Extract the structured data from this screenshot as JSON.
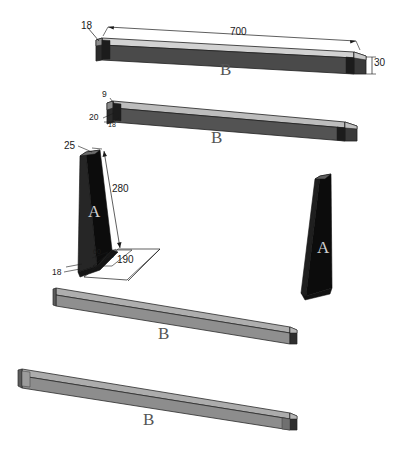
{
  "drawing": {
    "background_color": "#ffffff",
    "line_color": "#1a1a1a",
    "parts": [
      {
        "id": "bar-b-top",
        "part_label": "B",
        "color_top": "#cfcfcf",
        "color_face": "#4d4d4d",
        "color_end": "#3a3a3a",
        "dimensions": [
          {
            "name": "width-left",
            "value": "18"
          },
          {
            "name": "length",
            "value": "700"
          },
          {
            "name": "height-right",
            "value": "30"
          }
        ]
      },
      {
        "id": "bar-b-second",
        "part_label": "B",
        "color_top": "#b8b8b8",
        "color_face": "#555555",
        "color_end": "#3a3a3a",
        "dimensions": [
          {
            "name": "thickness-top",
            "value": "9"
          },
          {
            "name": "height",
            "value": "20"
          },
          {
            "name": "width",
            "value": "18"
          }
        ]
      },
      {
        "id": "bracket-a-left",
        "part_label": "A",
        "color_face": "#0c0c0c",
        "color_side": "#2a2a2a",
        "dimensions": [
          {
            "name": "top-width",
            "value": "25"
          },
          {
            "name": "slant-height",
            "value": "280"
          },
          {
            "name": "base-depth",
            "value": "190"
          },
          {
            "name": "base-inner-a",
            "value": "60"
          },
          {
            "name": "base-inner-b",
            "value": "90"
          },
          {
            "name": "base-thickness",
            "value": "18"
          }
        ]
      },
      {
        "id": "bracket-a-right",
        "part_label": "A",
        "color_face": "#0c0c0c",
        "color_side": "#242424",
        "dimensions": []
      },
      {
        "id": "bar-b-third",
        "part_label": "B",
        "color_top": "#a8a8a8",
        "color_face": "#909090",
        "color_end": "#2e2e2e",
        "dimensions": []
      },
      {
        "id": "bar-b-fourth",
        "part_label": "B",
        "color_top": "#a8a8a8",
        "color_face": "#8e8e8e",
        "color_end": "#2e2e2e",
        "dimensions": []
      }
    ],
    "labels": {
      "bar1_B": "B",
      "bar1_dim_18": "18",
      "bar1_dim_700": "700",
      "bar1_dim_30": "30",
      "bar2_B": "B",
      "bar2_dim_9": "9",
      "bar2_dim_20": "20",
      "bar2_dim_18": "18",
      "bracketA_left_letter": "A",
      "bracketA_dim_25": "25",
      "bracketA_dim_280": "280",
      "bracketA_dim_190": "190",
      "bracketA_dim_60": "60",
      "bracketA_dim_90": "90",
      "bracketA_dim_18": "18",
      "bracketA_right_letter": "A",
      "bar3_B": "B",
      "bar4_B": "B"
    }
  }
}
